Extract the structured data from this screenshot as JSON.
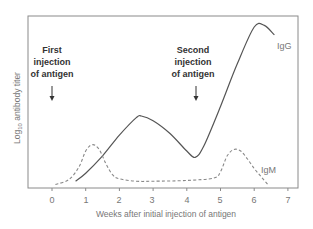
{
  "chart_data": {
    "type": "line",
    "title": "",
    "xlabel": "Weeks after initial injection of antigen",
    "ylabel": "Log10 antibody titer",
    "ylabel_main": "Log",
    "ylabel_sub": "10",
    "ylabel_rest": " antibody titer",
    "xlim": [
      -0.7,
      7.3
    ],
    "ylim": [
      0,
      10
    ],
    "x_ticks": [
      0,
      1,
      2,
      3,
      4,
      5,
      6,
      7
    ],
    "x_tick_labels": [
      "0",
      "1",
      "2",
      "3",
      "4",
      "5",
      "6",
      "7"
    ],
    "y_ticks": [],
    "grid": false,
    "legend": "inline labels",
    "series": [
      {
        "name": "IgG",
        "style": "solid",
        "color": "#555555",
        "x": [
          0.7,
          1.0,
          1.5,
          2.0,
          2.5,
          2.65,
          3.0,
          3.5,
          4.0,
          4.25,
          4.5,
          5.0,
          5.5,
          6.0,
          6.3,
          6.6
        ],
        "y": [
          0.3,
          0.8,
          1.9,
          3.2,
          4.3,
          4.4,
          4.1,
          3.3,
          2.2,
          1.8,
          2.5,
          5.0,
          7.7,
          10.0,
          10.1,
          9.5
        ]
      },
      {
        "name": "IgM",
        "style": "dashed",
        "color": "#888888",
        "x": [
          0.1,
          0.5,
          0.8,
          1.0,
          1.2,
          1.4,
          1.6,
          1.8,
          2.0,
          2.5,
          3.0,
          4.0,
          4.8,
          5.0,
          5.2,
          5.4,
          5.6,
          5.8,
          6.0,
          6.2,
          6.4
        ],
        "y": [
          0.1,
          0.4,
          1.2,
          2.2,
          2.6,
          2.3,
          1.4,
          0.7,
          0.45,
          0.3,
          0.3,
          0.35,
          0.5,
          0.9,
          1.9,
          2.3,
          2.2,
          1.7,
          1.1,
          0.6,
          0.1
        ]
      }
    ],
    "annotations": [
      {
        "lines": [
          "First",
          "injection",
          "of antigen"
        ],
        "x": 0,
        "arrow": "down"
      },
      {
        "lines": [
          "Second",
          "injection",
          "of antigen"
        ],
        "x": 4.3,
        "arrow": "down"
      }
    ],
    "series_labels": [
      {
        "text": "IgG",
        "near_x": 6.7
      },
      {
        "text": "IgM",
        "near_x": 6.2
      }
    ]
  }
}
